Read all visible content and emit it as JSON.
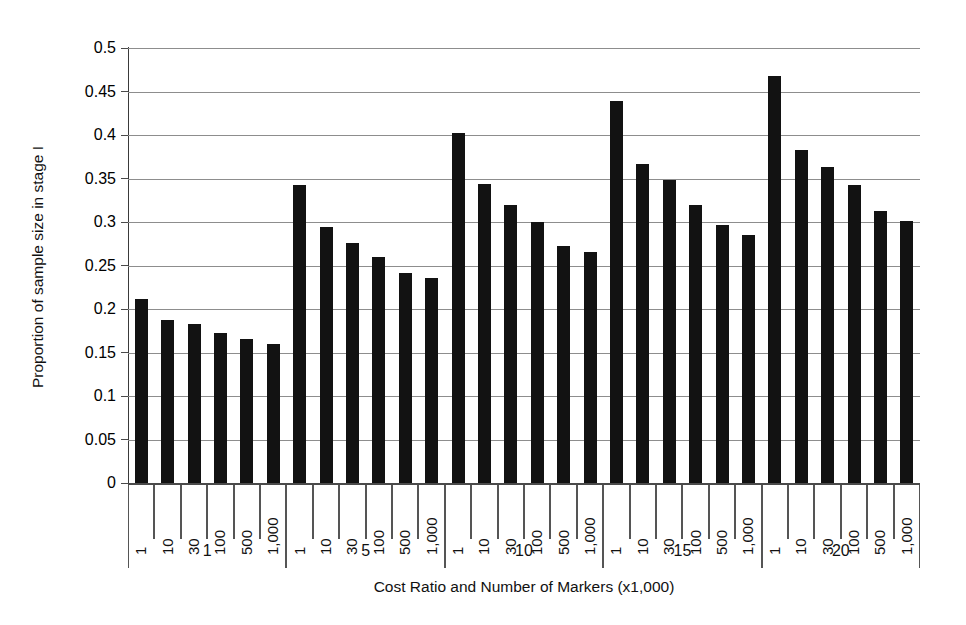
{
  "chart_data": {
    "type": "bar",
    "title": "",
    "xlabel": "Cost Ratio and Number of Markers (x1,000)",
    "ylabel": "Proportion of sample size in stage I",
    "ylim": [
      0,
      0.5
    ],
    "ytick_labels": [
      "0.5",
      "0.45",
      "0.4",
      "0.35",
      "0.3",
      "0.25",
      "0.2",
      "0.15",
      "0.1",
      "0.05",
      "0"
    ],
    "ytick_values": [
      0.5,
      0.45,
      0.4,
      0.35,
      0.3,
      0.25,
      0.2,
      0.15,
      0.1,
      0.05,
      0
    ],
    "grid": true,
    "legend": "none",
    "group_label_name": "Cost Ratio",
    "inner_label_name": "Number of Markers (x1,000)",
    "categories": [
      "1",
      "10",
      "30",
      "100",
      "500",
      "1,000"
    ],
    "groups": [
      {
        "label": "1",
        "values": [
          0.211,
          0.187,
          0.183,
          0.172,
          0.166,
          0.16
        ]
      },
      {
        "label": "5",
        "values": [
          0.343,
          0.294,
          0.276,
          0.26,
          0.241,
          0.236
        ]
      },
      {
        "label": "10",
        "values": [
          0.402,
          0.344,
          0.32,
          0.3,
          0.273,
          0.265
        ]
      },
      {
        "label": "15",
        "values": [
          0.439,
          0.367,
          0.348,
          0.319,
          0.297,
          0.285
        ]
      },
      {
        "label": "20",
        "values": [
          0.468,
          0.383,
          0.363,
          0.342,
          0.313,
          0.301
        ]
      }
    ],
    "bar_color": "#121212",
    "gridline_color": "#8d8d8d",
    "axis_color": "#4a4a4a"
  }
}
